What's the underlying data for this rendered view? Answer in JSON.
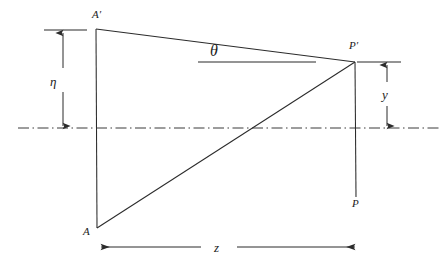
{
  "figure": {
    "kind": "geometric-optics-ray-diagram",
    "background_color": "#ffffff",
    "line_color": "#2b2b2b",
    "axis_color": "#3a3a3a",
    "width": 444,
    "height": 266
  },
  "points": {
    "a_prime": {
      "label": "A′",
      "x": 96,
      "y": 29,
      "label_x": 92,
      "label_y": 9
    },
    "a": {
      "label": "A",
      "x": 97,
      "y": 228,
      "label_x": 83,
      "label_y": 226
    },
    "p_prime": {
      "label": "P′",
      "x": 355,
      "y": 62,
      "label_x": 349,
      "label_y": 40
    },
    "p": {
      "label": "P",
      "x": 356,
      "y": 197,
      "label_x": 352,
      "label_y": 198
    }
  },
  "angle": {
    "label": "θ",
    "label_x": 210,
    "label_y": 43,
    "reference_line": {
      "x1": 198,
      "y1": 62,
      "x2": 316,
      "y2": 62
    }
  },
  "dimensions": {
    "eta": {
      "label": "η",
      "label_x": 50,
      "label_y": 75,
      "axis_x": 63,
      "y_top": 31,
      "y_bottom": 127,
      "tick": {
        "x1": 44,
        "y1": 30,
        "x2": 87,
        "y2": 30
      }
    },
    "y": {
      "label": "y",
      "label_x": 382,
      "label_y": 88,
      "axis_x": 387,
      "y_top": 64,
      "y_bottom": 127,
      "tick": {
        "x1": 357,
        "y1": 62,
        "x2": 401,
        "y2": 62
      }
    },
    "z": {
      "label": "z",
      "label_x": 214,
      "label_y": 241,
      "baseline_y": 247,
      "left_segment": {
        "x1": 100,
        "x2": 201
      },
      "right_segment": {
        "x1": 237,
        "x2": 356
      }
    }
  },
  "optical_axis": {
    "name": "optical-axis",
    "style": "dash-dot",
    "y": 128,
    "x1": 18,
    "x2": 440
  },
  "rays": {
    "upper_ray": {
      "from": "a_prime",
      "to": "p_prime"
    },
    "chief_ray": {
      "from": "a",
      "to": "p_prime"
    },
    "object_plane": {
      "from": "a_prime",
      "to": "a"
    },
    "image_plane": {
      "from": "p_prime",
      "to": "p"
    }
  }
}
